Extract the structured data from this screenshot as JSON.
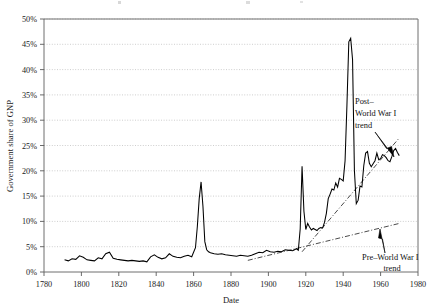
{
  "figure": {
    "title_partial": "",
    "background": "#ffffff",
    "line_color": "#000000",
    "grid_color": "#b9b9b9",
    "trend_color": "#2b2b2b"
  },
  "annotations": [
    {
      "id": "post-wwi",
      "lines": [
        "Post–",
        "World War I",
        "trend"
      ],
      "x": 355,
      "y": 104,
      "arrow_from": [
        376,
        131
      ],
      "arrow_to": [
        392,
        154
      ]
    },
    {
      "id": "pre-wwi",
      "lines": [
        "Pre–World War I",
        "trend"
      ],
      "x": 362,
      "y": 256,
      "arrow_from": [
        386,
        252
      ],
      "arrow_to": [
        381,
        230
      ]
    }
  ],
  "chart_data": {
    "type": "line",
    "title": "",
    "xlabel": "Date",
    "ylabel": "Government share of GNP",
    "xlim": [
      1780,
      1980
    ],
    "ylim": [
      0,
      50
    ],
    "xticks": [
      1780,
      1800,
      1820,
      1840,
      1860,
      1880,
      1900,
      1920,
      1940,
      1960,
      1980
    ],
    "xtick_labels": [
      "1780",
      "1800",
      "1820",
      "1840",
      "1860",
      "1880",
      "1900",
      "1920",
      "1940",
      "1960",
      "1980"
    ],
    "yticks": [
      0,
      5,
      10,
      15,
      20,
      25,
      30,
      35,
      40,
      45,
      50
    ],
    "ytick_labels": [
      "0%",
      "5%",
      "10%",
      "15%",
      "20%",
      "25%",
      "30%",
      "35%",
      "40%",
      "45%",
      "50%"
    ],
    "grid": "horizontal-dotted",
    "legend": "none",
    "units": "percent of GNP",
    "series": [
      {
        "name": "Government share of GNP",
        "style": "solid",
        "x": [
          1791,
          1793,
          1795,
          1797,
          1799,
          1801,
          1803,
          1805,
          1807,
          1809,
          1811,
          1813,
          1815,
          1817,
          1819,
          1821,
          1823,
          1825,
          1827,
          1829,
          1831,
          1833,
          1835,
          1837,
          1839,
          1841,
          1843,
          1845,
          1847,
          1849,
          1851,
          1853,
          1855,
          1857,
          1859,
          1861,
          1862,
          1863,
          1864,
          1865,
          1866,
          1867,
          1868,
          1869,
          1871,
          1873,
          1875,
          1877,
          1879,
          1881,
          1883,
          1885,
          1887,
          1889,
          1891,
          1893,
          1895,
          1897,
          1899,
          1901,
          1903,
          1905,
          1907,
          1909,
          1911,
          1913,
          1915,
          1916,
          1917,
          1918,
          1919,
          1920,
          1921,
          1922,
          1923,
          1924,
          1925,
          1926,
          1927,
          1928,
          1929,
          1930,
          1931,
          1932,
          1933,
          1934,
          1935,
          1936,
          1937,
          1938,
          1939,
          1940,
          1941,
          1942,
          1943,
          1944,
          1945,
          1946,
          1947,
          1948,
          1949,
          1950,
          1951,
          1952,
          1953,
          1954,
          1955,
          1956,
          1957,
          1958,
          1959,
          1960,
          1961,
          1962,
          1963,
          1964,
          1965,
          1966,
          1967,
          1968,
          1969,
          1970
        ],
        "y": [
          2.4,
          2.2,
          2.6,
          2.5,
          3.2,
          2.9,
          2.4,
          2.3,
          2.2,
          2.8,
          2.6,
          3.6,
          3.9,
          2.7,
          2.5,
          2.4,
          2.3,
          2.2,
          2.3,
          2.2,
          2.1,
          2.2,
          2.0,
          3.0,
          3.4,
          2.9,
          2.6,
          2.8,
          3.6,
          3.1,
          2.9,
          2.8,
          3.1,
          3.3,
          3.0,
          4.8,
          9.0,
          14.5,
          17.8,
          13.0,
          6.0,
          4.4,
          4.0,
          3.8,
          3.6,
          3.5,
          3.6,
          3.4,
          3.3,
          3.2,
          3.1,
          3.3,
          3.2,
          3.1,
          3.3,
          3.6,
          3.9,
          3.8,
          4.3,
          4.0,
          3.9,
          4.1,
          4.0,
          4.4,
          4.3,
          4.2,
          4.6,
          4.3,
          8.5,
          20.9,
          12.0,
          8.4,
          9.6,
          8.9,
          8.3,
          8.6,
          8.4,
          8.2,
          8.6,
          8.8,
          8.7,
          9.8,
          11.6,
          14.5,
          15.4,
          16.4,
          16.2,
          17.6,
          16.8,
          18.5,
          18.3,
          18.0,
          22.0,
          33.0,
          45.5,
          46.2,
          42.0,
          20.0,
          13.5,
          14.2,
          17.0,
          16.8,
          21.0,
          23.5,
          23.8,
          21.5,
          20.8,
          21.4,
          22.0,
          23.5,
          22.2,
          22.4,
          23.2,
          23.0,
          22.6,
          22.0,
          21.8,
          22.8,
          24.0,
          24.4,
          23.6,
          23.0
        ]
      }
    ],
    "trend_lines": [
      {
        "name": "Pre–World War I trend",
        "style": "dash-dot",
        "x": [
          1889,
          1970
        ],
        "y": [
          2.3,
          9.6
        ]
      },
      {
        "name": "Post–World War I trend",
        "style": "dash-dot",
        "x": [
          1918,
          1970
        ],
        "y": [
          4.0,
          26.5
        ]
      }
    ],
    "events": [
      {
        "label": "Civil War peak",
        "x": 1864,
        "y": 17.8
      },
      {
        "label": "World War I peak",
        "x": 1918,
        "y": 20.9
      },
      {
        "label": "World War II peak",
        "x": 1944,
        "y": 46.2
      }
    ]
  }
}
